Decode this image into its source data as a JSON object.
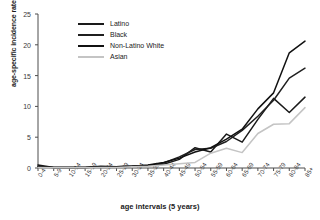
{
  "chart_data": {
    "type": "line",
    "title": "",
    "xlabel": "age intervals (5 years)",
    "ylabel": "age-specific incidence rate",
    "categories": [
      "0-4",
      "5-9",
      "10-14",
      "15-19",
      "20-24",
      "25-29",
      "30-34",
      "35-39",
      "40-44",
      "45-49",
      "50-54",
      "55-59",
      "60-64",
      "65-69",
      "70-74",
      "75-79",
      "80-84",
      "85+"
    ],
    "yticks": [
      0,
      5,
      10,
      15,
      20,
      25
    ],
    "ylim": [
      0,
      25
    ],
    "grid": false,
    "legend_position": "upper-left-inside",
    "series": [
      {
        "name": "Latino",
        "color": "#1a1a1a",
        "values": [
          0.5,
          0.1,
          0.1,
          0.1,
          0.3,
          0.2,
          0.3,
          0.4,
          0.6,
          1.4,
          3.3,
          2.6,
          5.5,
          4.2,
          7.9,
          11.3,
          9.0,
          11.5
        ]
      },
      {
        "name": "Black",
        "color": "#1f1f1f",
        "values": [
          0.2,
          0.1,
          0.1,
          0.1,
          0.2,
          0.2,
          0.3,
          0.4,
          0.8,
          1.8,
          3.0,
          3.2,
          4.3,
          6.1,
          8.4,
          11.0,
          14.6,
          16.2
        ]
      },
      {
        "name": "Non-Latino White",
        "color": "#111111",
        "values": [
          0.3,
          0.1,
          0.1,
          0.1,
          0.2,
          0.2,
          0.3,
          0.5,
          0.9,
          1.6,
          2.6,
          3.3,
          4.7,
          6.3,
          9.6,
          12.2,
          18.7,
          20.6
        ]
      },
      {
        "name": "Asian",
        "color": "#c4c4c4",
        "values": [
          0.1,
          0.05,
          0.05,
          0.05,
          0.1,
          0.1,
          0.2,
          0.3,
          0.5,
          0.7,
          0.9,
          2.4,
          3.2,
          2.5,
          5.6,
          7.1,
          7.2,
          9.8
        ]
      }
    ]
  }
}
